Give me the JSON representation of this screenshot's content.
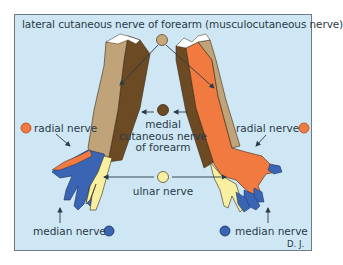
{
  "diagram": {
    "title": "lateral cutaneous nerve of forearm (musculocutaneous nerve)",
    "labels": {
      "radial_left": "radial nerve",
      "radial_right": "radial nerve",
      "medial_line1": "medial",
      "medial_line2": "cutaneous nerve",
      "medial_line3": "of forearm",
      "ulnar": "ulnar nerve",
      "median_left": "median nerve",
      "median_right": "median nerve",
      "signature": "D. J."
    },
    "legend": [
      {
        "nerve": "lateral cutaneous nerve of forearm (musculocutaneous nerve)",
        "color": "#c8a878"
      },
      {
        "nerve": "medial cutaneous nerve of forearm",
        "color": "#6b4a24"
      },
      {
        "nerve": "radial nerve",
        "color": "#f07a40"
      },
      {
        "nerve": "ulnar nerve",
        "color": "#f8f0a0"
      },
      {
        "nerve": "median nerve",
        "color": "#3a64b4"
      }
    ],
    "colors": {
      "background": "#cfe7f4",
      "frame_border": "#6d7b85",
      "text": "#2a3a48",
      "arrow": "#2a3a48"
    }
  }
}
